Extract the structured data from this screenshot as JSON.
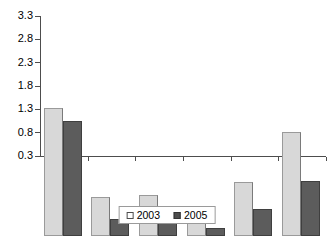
{
  "chart_data": {
    "type": "bar",
    "title": "",
    "subtitle": "",
    "xlabel": "",
    "ylabel": "",
    "categories": [
      "Bahrain",
      "Kuwait",
      "Oman",
      "Qatar",
      "Saudi\nArabia",
      "UAE"
    ],
    "series": [
      {
        "name": "2003",
        "color": "#d8d8d8",
        "values": [
          3.05,
          1.13,
          1.18,
          0.72,
          1.45,
          2.52
        ]
      },
      {
        "name": "2005",
        "color": "#5c5c5c",
        "values": [
          2.76,
          0.66,
          0.89,
          0.48,
          0.87,
          1.47
        ]
      }
    ],
    "ylim": [
      0.3,
      3.3
    ],
    "yticks": [
      "0.3",
      "0.8",
      "1.3",
      "1.8",
      "2.3",
      "2.8",
      "3.3"
    ],
    "ytick_values": [
      0.3,
      0.8,
      1.3,
      1.8,
      2.3,
      2.8,
      3.3
    ],
    "grid": false,
    "legend_position": "bottom",
    "legend": [
      "2003",
      "2005"
    ],
    "axis_color": "#4d4d4d"
  }
}
